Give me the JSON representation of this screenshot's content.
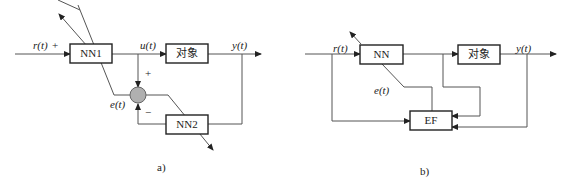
{
  "diagram_a": {
    "caption": "a)",
    "blocks": {
      "nn1": "NN1",
      "plant": "对象",
      "nn2": "NN2"
    },
    "signals": {
      "input": "r(t)",
      "input_sign": "+",
      "control": "u(t)",
      "output": "y(t)",
      "error": "e(t)",
      "plus": "+",
      "minus": "−"
    },
    "summing_junction_color": "#b0b0b0"
  },
  "diagram_b": {
    "caption": "b)",
    "blocks": {
      "nn": "NN",
      "plant": "对象",
      "ef": "EF"
    },
    "signals": {
      "input": "r(t)",
      "output": "y(t)",
      "error": "e(t)"
    }
  }
}
